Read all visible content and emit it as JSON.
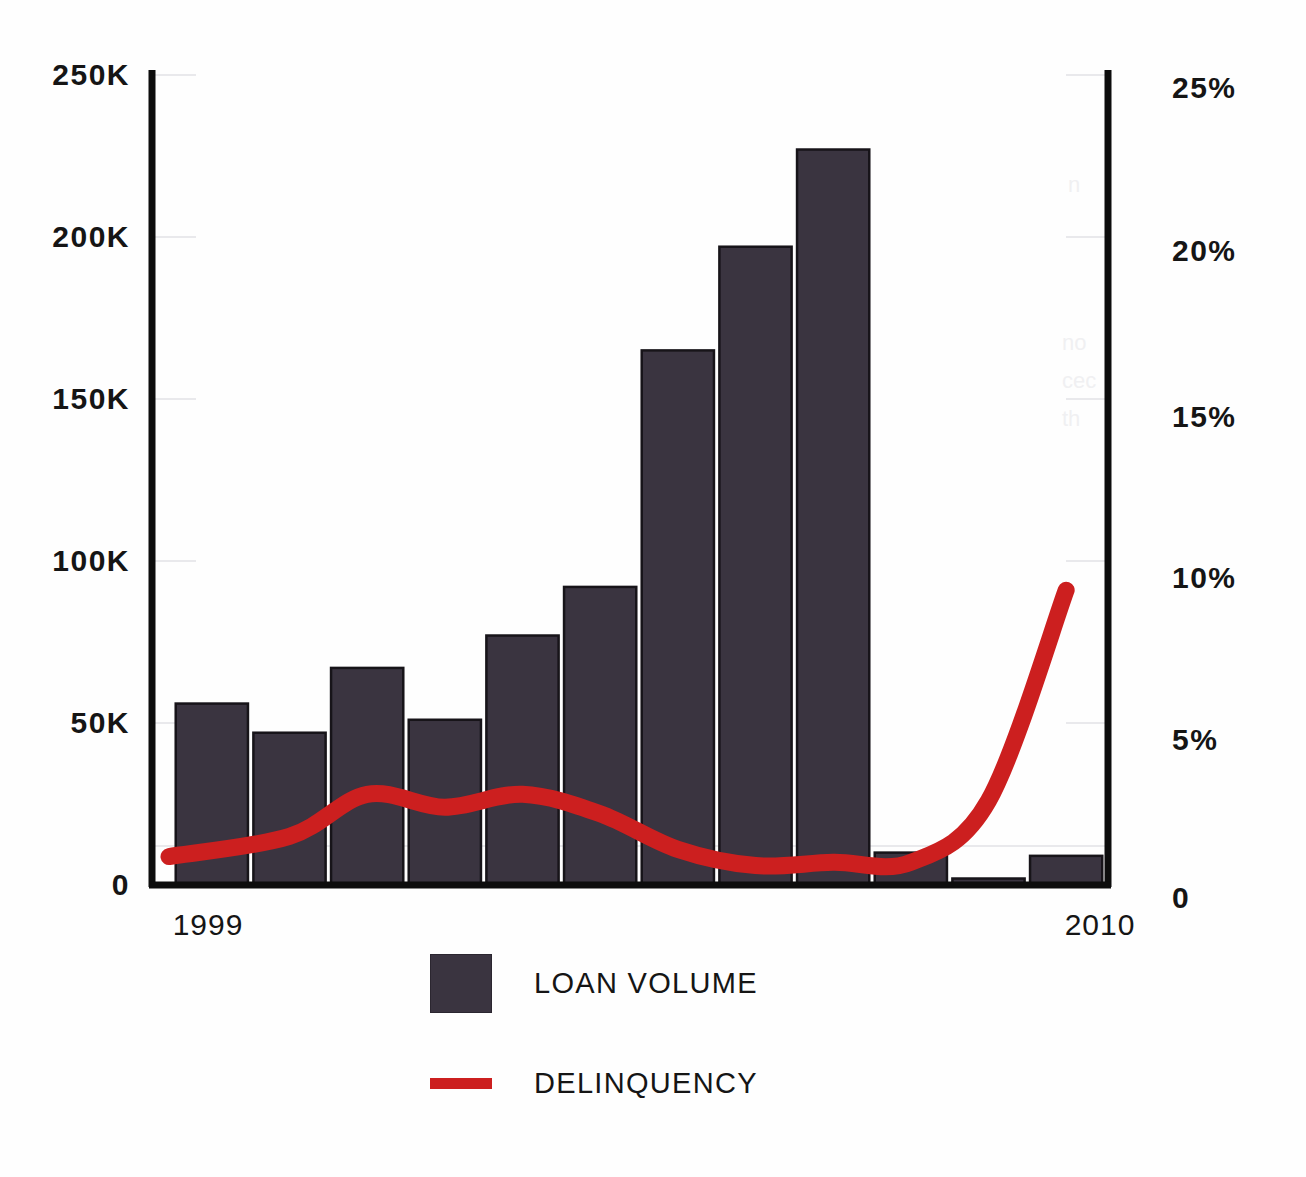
{
  "chart_data": {
    "type": "bar",
    "title": "",
    "subtitle": "",
    "xlabel": "",
    "ylabel": "",
    "grid": false,
    "legend_position": "bottom-center",
    "categories": [
      "1999",
      "2000",
      "2001",
      "2002",
      "2003",
      "2004",
      "2005",
      "2006",
      "2007",
      "2008",
      "2009",
      "2010"
    ],
    "xtick_labels_shown": [
      "1999",
      "2010"
    ],
    "axes": {
      "left": {
        "label": "",
        "ylim": [
          0,
          250000
        ],
        "ticks": [
          0,
          50000,
          100000,
          150000,
          200000,
          250000
        ],
        "tick_labels": [
          "0",
          "50K",
          "100K",
          "150K",
          "200K",
          "250K"
        ]
      },
      "right": {
        "label": "",
        "ylim": [
          0,
          25
        ],
        "ticks": [
          0,
          5,
          10,
          15,
          20,
          25
        ],
        "tick_labels": [
          "0",
          "5%",
          "10%",
          "15%",
          "20%",
          "25%"
        ]
      }
    },
    "series": [
      {
        "name": "LOAN VOLUME",
        "type": "bar",
        "axis": "left",
        "color": "#3a3440",
        "values": [
          56000,
          47000,
          67000,
          51000,
          77000,
          92000,
          165000,
          197000,
          227000,
          10000,
          2000,
          9000
        ]
      },
      {
        "name": "DELINQUENCY",
        "type": "line",
        "axis": "right",
        "color": "#cc1f1f",
        "values": [
          1.0,
          1.5,
          2.8,
          2.4,
          2.8,
          2.2,
          1.1,
          0.6,
          0.7,
          0.7,
          2.6,
          9.1
        ]
      }
    ]
  },
  "legend": {
    "items": [
      {
        "label": "LOAN VOLUME",
        "key": "swatch-box",
        "color": "#3a3440"
      },
      {
        "label": "DELINQUENCY",
        "key": "swatch-line",
        "color": "#cc1f1f"
      }
    ]
  },
  "colors": {
    "bar": "#3a3440",
    "line": "#cc1f1f",
    "axis": "#0d0d0d",
    "background": "#fefefe",
    "text": "#151515"
  },
  "showthrough": {
    "fragments": [
      "n",
      "no",
      "cec",
      "th"
    ]
  }
}
